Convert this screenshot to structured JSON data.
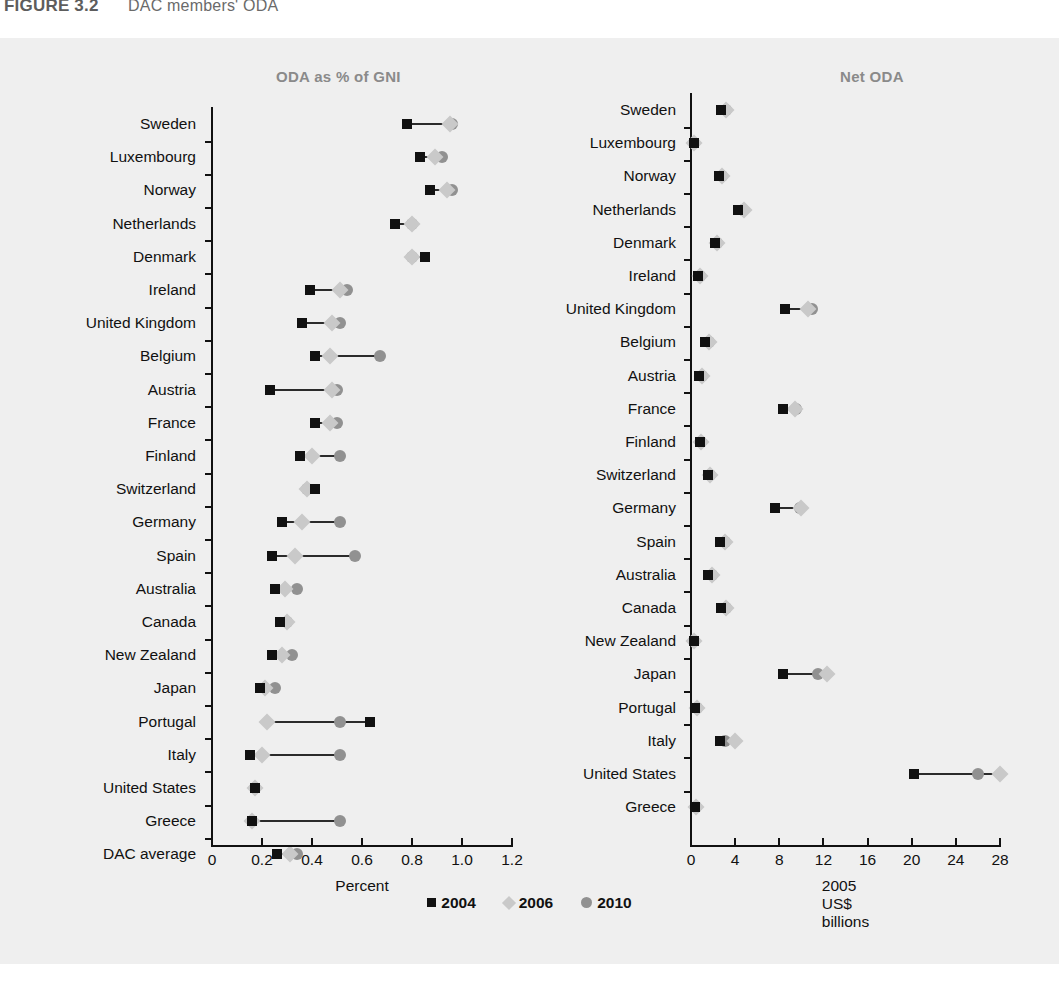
{
  "header": {
    "figure_number": "FIGURE 3.2",
    "title": "DAC members' ODA"
  },
  "legend": [
    {
      "label": "2004",
      "marker": "square-marker",
      "color": "#111111"
    },
    {
      "label": "2006",
      "marker": "diamond-marker",
      "color": "#c9c9c9"
    },
    {
      "label": "2010",
      "marker": "circle-marker",
      "color": "#919191"
    }
  ],
  "chart_data": [
    {
      "id": "oda-percent-gni",
      "type": "scatter",
      "title": "ODA as % of GNI",
      "xlabel": "Percent",
      "ylabel": "",
      "xlim": [
        0,
        1.2
      ],
      "xticks": [
        0,
        0.2,
        0.4,
        0.6,
        0.8,
        1.0,
        1.2
      ],
      "xticklabels": [
        "0",
        "0.2",
        "0.4",
        "0.6",
        "0.8",
        "1.0",
        "1.2"
      ],
      "grid": false,
      "legend_position": "bottom",
      "categories": [
        "Sweden",
        "Luxembourg",
        "Norway",
        "Netherlands",
        "Denmark",
        "Ireland",
        "United Kingdom",
        "Belgium",
        "Austria",
        "France",
        "Finland",
        "Switzerland",
        "Germany",
        "Spain",
        "Australia",
        "Canada",
        "New Zealand",
        "Japan",
        "Portugal",
        "Italy",
        "United States",
        "Greece",
        "DAC average"
      ],
      "series": [
        {
          "name": "2004",
          "values": [
            0.78,
            0.83,
            0.87,
            0.73,
            0.85,
            0.39,
            0.36,
            0.41,
            0.23,
            0.41,
            0.35,
            0.41,
            0.28,
            0.24,
            0.25,
            0.27,
            0.24,
            0.19,
            0.63,
            0.15,
            0.17,
            0.16,
            0.26
          ]
        },
        {
          "name": "2006",
          "values": [
            0.95,
            0.89,
            0.94,
            0.8,
            0.8,
            0.51,
            0.48,
            0.47,
            0.48,
            0.47,
            0.4,
            0.38,
            0.36,
            0.33,
            0.29,
            0.3,
            0.28,
            0.21,
            0.22,
            0.2,
            0.17,
            0.16,
            0.31
          ]
        },
        {
          "name": "2010",
          "values": [
            0.96,
            0.92,
            0.96,
            0.8,
            0.8,
            0.54,
            0.51,
            0.67,
            0.5,
            0.5,
            0.51,
            0.38,
            0.51,
            0.57,
            0.34,
            0.3,
            0.32,
            0.25,
            0.51,
            0.51,
            0.17,
            0.51,
            0.34
          ]
        }
      ]
    },
    {
      "id": "net-oda",
      "type": "scatter",
      "title": "Net ODA",
      "xlabel": "2005 US$ billions",
      "ylabel": "",
      "xlim": [
        0,
        28
      ],
      "xticks": [
        0,
        4,
        8,
        12,
        16,
        20,
        24,
        28
      ],
      "xticklabels": [
        "0",
        "4",
        "8",
        "12",
        "16",
        "20",
        "24",
        "28"
      ],
      "grid": false,
      "legend_position": "bottom",
      "categories": [
        "Sweden",
        "Luxembourg",
        "Norway",
        "Netherlands",
        "Denmark",
        "Ireland",
        "United Kingdom",
        "Belgium",
        "Austria",
        "France",
        "Finland",
        "Switzerland",
        "Germany",
        "Spain",
        "Australia",
        "Canada",
        "New Zealand",
        "Japan",
        "Portugal",
        "Italy",
        "United States",
        "Greece"
      ],
      "series": [
        {
          "name": "2004",
          "values": [
            2.7,
            0.25,
            2.5,
            4.3,
            2.2,
            0.65,
            8.5,
            1.3,
            0.7,
            8.3,
            0.8,
            1.5,
            7.6,
            2.6,
            1.5,
            2.7,
            0.25,
            8.3,
            0.4,
            2.6,
            20.2,
            0.35
          ]
        },
        {
          "name": "2006",
          "values": [
            3.2,
            0.3,
            2.8,
            4.8,
            2.4,
            0.8,
            10.6,
            1.6,
            1.0,
            9.4,
            0.9,
            1.7,
            10.0,
            3.1,
            1.9,
            3.2,
            0.3,
            12.3,
            0.5,
            4.0,
            28.0,
            0.45
          ]
        },
        {
          "name": "2010",
          "values": [
            3.2,
            0.3,
            2.8,
            4.7,
            2.4,
            0.8,
            11.0,
            1.6,
            1.0,
            9.5,
            0.9,
            1.7,
            9.9,
            3.1,
            1.9,
            3.2,
            0.3,
            11.5,
            0.5,
            3.1,
            26.0,
            0.45
          ]
        }
      ]
    }
  ]
}
